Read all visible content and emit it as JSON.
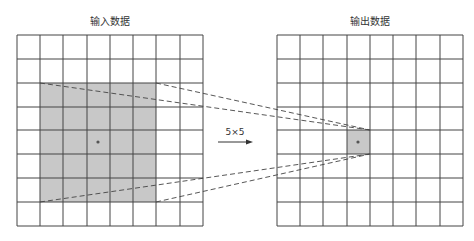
{
  "input_grid": {
    "title": "输入数据",
    "rows": 8,
    "cols": 8,
    "highlight": {
      "col_start": 1,
      "row_start": 2,
      "size": 5
    },
    "center_marker": {
      "col": 3,
      "row": 4
    }
  },
  "output_grid": {
    "title": "输出数据",
    "rows": 8,
    "cols": 8,
    "highlight": {
      "col": 3,
      "row": 4
    }
  },
  "kernel": {
    "label": "5×5"
  },
  "colors": {
    "grid_line": "#444444",
    "highlight_fill": "#c8c8c8",
    "dashed_line": "#444444",
    "dot": "#555555"
  }
}
